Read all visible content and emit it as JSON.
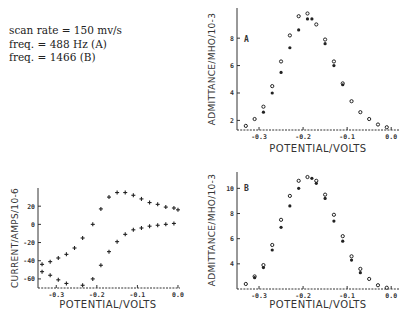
{
  "caption": {
    "line1": "scan rate = 150 mv/s",
    "line2": "freq. = 488 Hz (A)",
    "line3": "freq. = 1466 (B)"
  },
  "colors": {
    "ink": "#1a1a1a",
    "background": "#ffffff"
  },
  "chart_data": [
    {
      "id": "admittance-A",
      "type": "scatter",
      "panel_label": "A",
      "title": "",
      "xlabel": "POTENTIAL/VOLTS",
      "ylabel": "ADMITTANCE/MHO/10^-3",
      "xlim": [
        -0.35,
        0.02
      ],
      "ylim": [
        1.3,
        10.2
      ],
      "xticks": [
        -0.3,
        -0.2,
        -0.1,
        0.0
      ],
      "xtick_labels": [
        "-0.3",
        "-0.2",
        "-0.1",
        "0.0"
      ],
      "yticks": [
        2,
        4,
        6,
        8
      ],
      "ytick_labels": [
        "2",
        "4",
        "6",
        "8"
      ],
      "grid": false,
      "series": [
        {
          "name": "set-1",
          "marker": "circle-open",
          "x": [
            -0.33,
            -0.31,
            -0.29,
            -0.27,
            -0.25,
            -0.23,
            -0.21,
            -0.19,
            -0.17,
            -0.15,
            -0.13,
            -0.11,
            -0.09,
            -0.07,
            -0.05,
            -0.03,
            -0.01
          ],
          "y": [
            1.6,
            2.1,
            3.0,
            4.5,
            6.3,
            8.2,
            9.6,
            9.8,
            9.0,
            7.9,
            6.3,
            4.7,
            3.4,
            2.6,
            2.1,
            1.7,
            1.5
          ]
        },
        {
          "name": "set-2",
          "marker": "filled",
          "x": [
            -0.29,
            -0.27,
            -0.25,
            -0.23,
            -0.21,
            -0.19,
            -0.18,
            -0.15,
            -0.13,
            -0.11
          ],
          "y": [
            2.6,
            4.0,
            5.5,
            7.3,
            8.6,
            9.4,
            9.4,
            7.6,
            6.0,
            4.6
          ]
        }
      ]
    },
    {
      "id": "current-cv",
      "type": "scatter",
      "panel_label": "",
      "title": "",
      "xlabel": "POTENTIAL/VOLTS",
      "ylabel": "CURRENT/AMPS/10^-6",
      "xlim": [
        -0.345,
        0.005
      ],
      "ylim": [
        -70,
        40
      ],
      "xticks": [
        -0.3,
        -0.2,
        -0.1,
        0.0
      ],
      "xtick_labels": [
        "-0.3",
        "-0.2",
        "-0.1",
        "0.0"
      ],
      "yticks": [
        20,
        0,
        -20,
        -40,
        -60
      ],
      "ytick_labels": [
        "20",
        "0",
        "-20",
        "-40",
        "-60"
      ],
      "grid": false,
      "series": [
        {
          "name": "forward-scan",
          "marker": "plus",
          "x": [
            -0.335,
            -0.315,
            -0.295,
            -0.275,
            -0.255,
            -0.235,
            -0.21,
            -0.19,
            -0.17,
            -0.15,
            -0.13,
            -0.11,
            -0.09,
            -0.07,
            -0.05,
            -0.03,
            -0.01,
            0.0
          ],
          "y": [
            -44,
            -41,
            -37,
            -33,
            -26,
            -15,
            0,
            17,
            30,
            35,
            35,
            32,
            28,
            24,
            22,
            19,
            18,
            16
          ]
        },
        {
          "name": "reverse-scan",
          "marker": "plus",
          "x": [
            -0.335,
            -0.315,
            -0.295,
            -0.275,
            -0.235,
            -0.21,
            -0.19,
            -0.17,
            -0.15,
            -0.13,
            -0.11,
            -0.09,
            -0.07,
            -0.05,
            -0.03,
            -0.01
          ],
          "y": [
            -52,
            -56,
            -61,
            -65,
            -67,
            -60,
            -45,
            -30,
            -19,
            -11,
            -6,
            -4,
            -2,
            -1,
            0,
            1
          ]
        }
      ]
    },
    {
      "id": "admittance-B",
      "type": "scatter",
      "panel_label": "B",
      "title": "",
      "xlabel": "POTENTIAL/VOLTS",
      "ylabel": "ADMITTANCE/MHO/10^-3",
      "xlim": [
        -0.35,
        0.02
      ],
      "ylim": [
        2.0,
        11.3
      ],
      "xticks": [
        -0.3,
        -0.2,
        -0.1,
        0.0
      ],
      "xtick_labels": [
        "-0.3",
        "-0.2",
        "-0.1",
        "0.0"
      ],
      "yticks": [
        4,
        6,
        8,
        10
      ],
      "ytick_labels": [
        "4",
        "6",
        "8",
        "10"
      ],
      "grid": false,
      "series": [
        {
          "name": "set-1",
          "marker": "circle-open",
          "x": [
            -0.33,
            -0.31,
            -0.29,
            -0.27,
            -0.25,
            -0.23,
            -0.21,
            -0.19,
            -0.17,
            -0.15,
            -0.13,
            -0.11,
            -0.09,
            -0.07,
            -0.05,
            -0.03,
            -0.01
          ],
          "y": [
            2.4,
            3.0,
            3.9,
            5.5,
            7.5,
            9.4,
            10.6,
            10.9,
            10.6,
            9.5,
            7.9,
            6.2,
            4.6,
            3.6,
            2.8,
            2.3,
            2.1
          ]
        },
        {
          "name": "set-2",
          "marker": "filled",
          "x": [
            -0.31,
            -0.29,
            -0.27,
            -0.25,
            -0.23,
            -0.21,
            -0.18,
            -0.17,
            -0.15,
            -0.13,
            -0.11,
            -0.09,
            -0.07
          ],
          "y": [
            2.9,
            3.7,
            5.1,
            6.9,
            8.6,
            10.0,
            10.8,
            10.4,
            9.2,
            7.4,
            5.8,
            4.3,
            3.3
          ]
        }
      ]
    }
  ]
}
